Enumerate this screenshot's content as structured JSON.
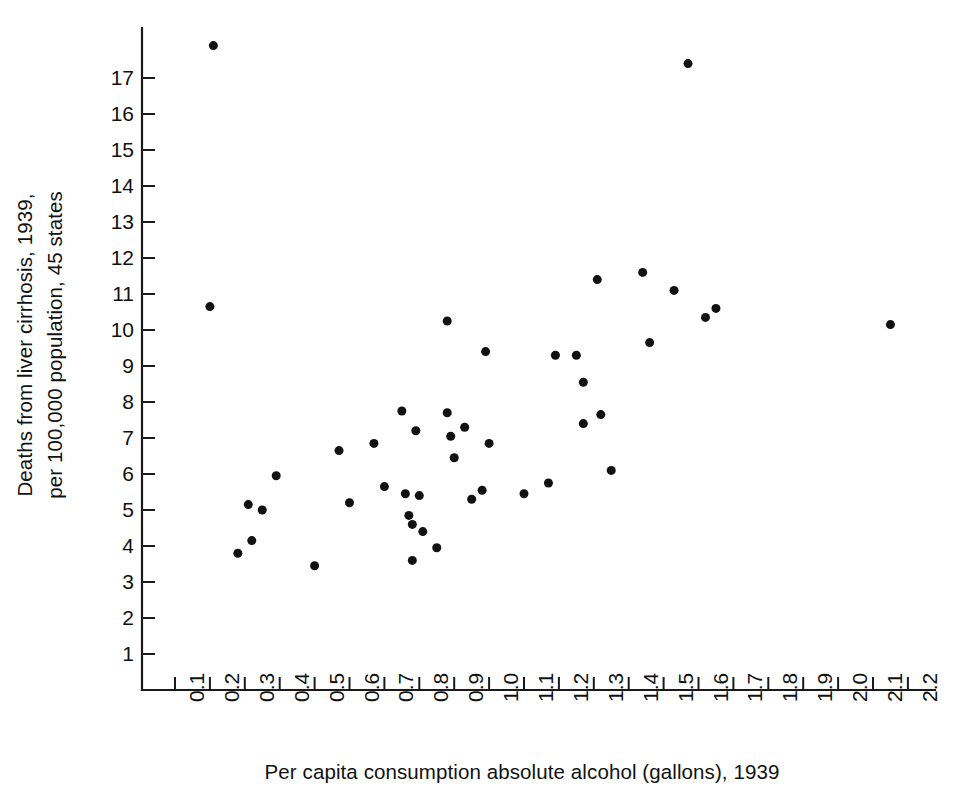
{
  "chart_data": {
    "type": "scatter",
    "title": "",
    "xlabel": "Per capita consumption absolute alcohol (gallons), 1939",
    "ylabel_lines": [
      "Deaths from liver cirrhosis, 1939,",
      "per 100,000 population, 45 states"
    ],
    "ylabel": "Deaths from liver cirrhosis, 1939, per 100,000 population, 45 states",
    "xlim": [
      0.05,
      2.25
    ],
    "ylim": [
      0.0,
      18.6
    ],
    "xticks": [
      "0.1",
      "0.2",
      "0.3",
      "0.4",
      "0.5",
      "0.6",
      "0.7",
      "0.8",
      "0.9",
      "1.0",
      "1.1",
      "1.2",
      "1.3",
      "1.4",
      "1.5",
      "1.6",
      "1.7",
      "1.8",
      "1.9",
      "2.0",
      "2.1",
      "2.2"
    ],
    "xtick_values": [
      0.1,
      0.2,
      0.3,
      0.4,
      0.5,
      0.6,
      0.7,
      0.8,
      0.9,
      1.0,
      1.1,
      1.2,
      1.3,
      1.4,
      1.5,
      1.6,
      1.7,
      1.8,
      1.9,
      2.0,
      2.1,
      2.2
    ],
    "yticks": [
      "1",
      "2",
      "3",
      "4",
      "5",
      "6",
      "7",
      "8",
      "9",
      "10",
      "11",
      "12",
      "13",
      "14",
      "15",
      "16",
      "17"
    ],
    "ytick_values": [
      1,
      2,
      3,
      4,
      5,
      6,
      7,
      8,
      9,
      10,
      11,
      12,
      13,
      14,
      15,
      16,
      17
    ],
    "grid": false,
    "legend": null,
    "n_points": 45,
    "marker_color": "#111111",
    "marker_size": 7,
    "points": [
      {
        "x": 0.21,
        "y": 17.9
      },
      {
        "x": 0.2,
        "y": 10.65
      },
      {
        "x": 0.28,
        "y": 3.8
      },
      {
        "x": 0.31,
        "y": 5.15
      },
      {
        "x": 0.32,
        "y": 4.15
      },
      {
        "x": 0.35,
        "y": 5.0
      },
      {
        "x": 0.39,
        "y": 5.95
      },
      {
        "x": 0.5,
        "y": 3.45
      },
      {
        "x": 0.57,
        "y": 6.65
      },
      {
        "x": 0.6,
        "y": 5.2
      },
      {
        "x": 0.67,
        "y": 6.85
      },
      {
        "x": 0.7,
        "y": 5.65
      },
      {
        "x": 0.75,
        "y": 7.75
      },
      {
        "x": 0.76,
        "y": 5.45
      },
      {
        "x": 0.77,
        "y": 4.85
      },
      {
        "x": 0.78,
        "y": 4.6
      },
      {
        "x": 0.78,
        "y": 3.6
      },
      {
        "x": 0.79,
        "y": 7.2
      },
      {
        "x": 0.8,
        "y": 5.4
      },
      {
        "x": 0.81,
        "y": 4.4
      },
      {
        "x": 0.85,
        "y": 3.95
      },
      {
        "x": 0.88,
        "y": 10.25
      },
      {
        "x": 0.88,
        "y": 7.7
      },
      {
        "x": 0.89,
        "y": 7.05
      },
      {
        "x": 0.9,
        "y": 6.45
      },
      {
        "x": 0.93,
        "y": 7.3
      },
      {
        "x": 0.95,
        "y": 5.3
      },
      {
        "x": 0.98,
        "y": 5.55
      },
      {
        "x": 0.99,
        "y": 9.4
      },
      {
        "x": 1.0,
        "y": 6.85
      },
      {
        "x": 1.1,
        "y": 5.45
      },
      {
        "x": 1.17,
        "y": 5.75
      },
      {
        "x": 1.19,
        "y": 9.3
      },
      {
        "x": 1.25,
        "y": 9.3
      },
      {
        "x": 1.27,
        "y": 8.55
      },
      {
        "x": 1.27,
        "y": 7.4
      },
      {
        "x": 1.31,
        "y": 11.4
      },
      {
        "x": 1.32,
        "y": 7.65
      },
      {
        "x": 1.35,
        "y": 6.1
      },
      {
        "x": 1.44,
        "y": 11.6
      },
      {
        "x": 1.46,
        "y": 9.65
      },
      {
        "x": 1.53,
        "y": 11.1
      },
      {
        "x": 1.57,
        "y": 17.4
      },
      {
        "x": 1.62,
        "y": 10.35
      },
      {
        "x": 1.65,
        "y": 10.6
      },
      {
        "x": 2.15,
        "y": 10.15
      }
    ]
  },
  "layout": {
    "plot_left_px": 142,
    "plot_bottom_px": 690,
    "x_origin_px": 175,
    "x_step_px": 34.9,
    "y_origin_px": 654,
    "y_step_px": 36.0
  }
}
